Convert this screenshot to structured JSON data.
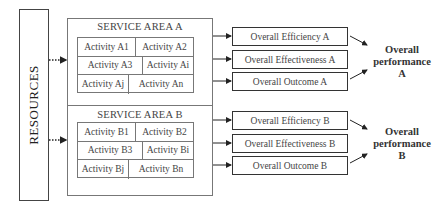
{
  "resources": {
    "label": "RESOURCES"
  },
  "service_areas": [
    {
      "title": "SERVICE AREA A",
      "rows": [
        [
          "Activity A1",
          "Activity A2"
        ],
        [
          "Activity A3",
          "Activity Ai"
        ],
        [
          "Activity Aj",
          "Activity An"
        ]
      ],
      "outputs": [
        "Overall Efficiency A",
        "Overall Effectiveness A",
        "Overall Outcome A"
      ],
      "performance": {
        "line1": "Overall",
        "line2": "performance",
        "line3": "A"
      }
    },
    {
      "title": "SERVICE AREA B",
      "rows": [
        [
          "Activity B1",
          "Activity B2"
        ],
        [
          "Activity B3",
          "Activity Bi"
        ],
        [
          "Activity Bj",
          "Activity Bn"
        ]
      ],
      "outputs": [
        "Overall Efficiency B",
        "Overall Effectiveness B",
        "Overall Outcome B"
      ],
      "performance": {
        "line1": "Overall",
        "line2": "performance",
        "line3": "B"
      }
    }
  ],
  "colors": {
    "line": "#333333",
    "box_border": "#777777",
    "text": "#444444"
  }
}
